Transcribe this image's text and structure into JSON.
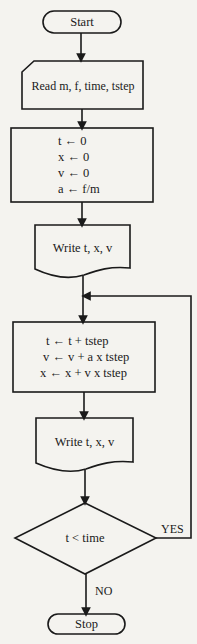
{
  "flowchart": {
    "start": {
      "label": "Start"
    },
    "input": {
      "label": "Read m, f, time, tstep"
    },
    "init": {
      "lines": [
        "t ← 0",
        "x ← 0",
        "v ← 0",
        "a ← f/m"
      ]
    },
    "output1": {
      "label": "Write t, x, v"
    },
    "update": {
      "lines": [
        "t ← t + tstep",
        "v ← v + a x tstep",
        "x ← x + v x tstep"
      ]
    },
    "output2": {
      "label": "Write t, x, v"
    },
    "decision": {
      "label": "t < time",
      "yes_label": "YES",
      "no_label": "NO"
    },
    "stop": {
      "label": "Stop"
    }
  },
  "colors": {
    "line": "#1a1a1a",
    "background": "#f4f3ef"
  }
}
